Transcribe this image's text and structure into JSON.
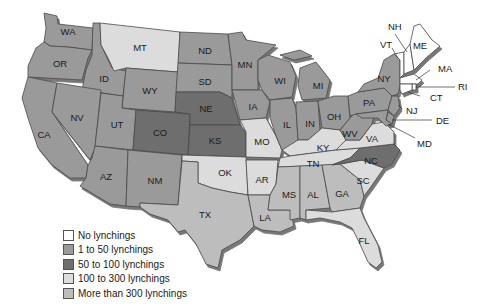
{
  "legend": {
    "items": [
      {
        "key": "none",
        "label": "No lynchings",
        "color": "#ffffff"
      },
      {
        "key": "low",
        "label": "1 to 50 lynchings",
        "color": "#9a9a9a"
      },
      {
        "key": "mid",
        "label": "50 to 100 lynchings",
        "color": "#6e6e6e"
      },
      {
        "key": "high",
        "label": "100 to 300 lynchings",
        "color": "#dcdcdc"
      },
      {
        "key": "vhigh",
        "label": "More than 300 lynchings",
        "color": "#bdbdbd"
      }
    ]
  },
  "states": [
    {
      "abbr": "WA",
      "category": "low"
    },
    {
      "abbr": "OR",
      "category": "low"
    },
    {
      "abbr": "CA",
      "category": "low"
    },
    {
      "abbr": "ID",
      "category": "low"
    },
    {
      "abbr": "NV",
      "category": "low"
    },
    {
      "abbr": "MT",
      "category": "high"
    },
    {
      "abbr": "WY",
      "category": "low"
    },
    {
      "abbr": "UT",
      "category": "low"
    },
    {
      "abbr": "AZ",
      "category": "low"
    },
    {
      "abbr": "CO",
      "category": "mid"
    },
    {
      "abbr": "NM",
      "category": "low"
    },
    {
      "abbr": "ND",
      "category": "low"
    },
    {
      "abbr": "SD",
      "category": "low"
    },
    {
      "abbr": "NE",
      "category": "mid"
    },
    {
      "abbr": "KS",
      "category": "mid"
    },
    {
      "abbr": "OK",
      "category": "high"
    },
    {
      "abbr": "TX",
      "category": "vhigh"
    },
    {
      "abbr": "MN",
      "category": "low"
    },
    {
      "abbr": "IA",
      "category": "low"
    },
    {
      "abbr": "MO",
      "category": "high"
    },
    {
      "abbr": "AR",
      "category": "high"
    },
    {
      "abbr": "LA",
      "category": "vhigh"
    },
    {
      "abbr": "WI",
      "category": "low"
    },
    {
      "abbr": "IL",
      "category": "low"
    },
    {
      "abbr": "MI",
      "category": "low"
    },
    {
      "abbr": "IN",
      "category": "low"
    },
    {
      "abbr": "OH",
      "category": "low"
    },
    {
      "abbr": "KY",
      "category": "high"
    },
    {
      "abbr": "TN",
      "category": "high"
    },
    {
      "abbr": "MS",
      "category": "vhigh"
    },
    {
      "abbr": "AL",
      "category": "vhigh"
    },
    {
      "abbr": "GA",
      "category": "vhigh"
    },
    {
      "abbr": "FL",
      "category": "high"
    },
    {
      "abbr": "SC",
      "category": "high"
    },
    {
      "abbr": "NC",
      "category": "mid"
    },
    {
      "abbr": "VA",
      "category": "high"
    },
    {
      "abbr": "WV",
      "category": "low"
    },
    {
      "abbr": "PA",
      "category": "low"
    },
    {
      "abbr": "NY",
      "category": "low"
    },
    {
      "abbr": "NJ",
      "category": "low"
    },
    {
      "abbr": "DE",
      "category": "low"
    },
    {
      "abbr": "MD",
      "category": "low"
    },
    {
      "abbr": "VT",
      "category": "none"
    },
    {
      "abbr": "NH",
      "category": "none"
    },
    {
      "abbr": "ME",
      "category": "none"
    },
    {
      "abbr": "MA",
      "category": "none"
    },
    {
      "abbr": "RI",
      "category": "none"
    },
    {
      "abbr": "CT",
      "category": "none"
    }
  ],
  "labels": {
    "WA": "WA",
    "OR": "OR",
    "CA": "CA",
    "ID": "ID",
    "NV": "NV",
    "MT": "MT",
    "WY": "WY",
    "UT": "UT",
    "AZ": "AZ",
    "CO": "CO",
    "NM": "NM",
    "ND": "ND",
    "SD": "SD",
    "NE": "NE",
    "KS": "KS",
    "OK": "OK",
    "TX": "TX",
    "MN": "MN",
    "IA": "IA",
    "MO": "MO",
    "AR": "AR",
    "LA": "LA",
    "WI": "WI",
    "IL": "IL",
    "MI": "MI",
    "IN": "IN",
    "OH": "OH",
    "KY": "KY",
    "TN": "TN",
    "MS": "MS",
    "AL": "AL",
    "GA": "GA",
    "FL": "FL",
    "SC": "SC",
    "NC": "NC",
    "VA": "VA",
    "WV": "WV",
    "PA": "PA",
    "NY": "NY",
    "NJ": "NJ",
    "DE": "DE",
    "MD": "MD",
    "VT": "VT",
    "NH": "NH",
    "ME": "ME",
    "MA": "MA",
    "RI": "RI",
    "CT": "CT"
  }
}
